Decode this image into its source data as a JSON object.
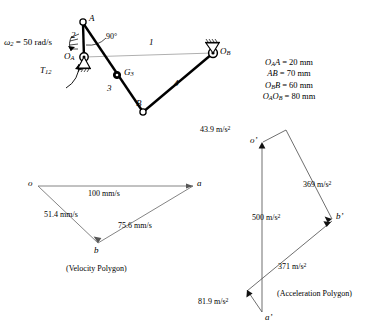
{
  "figure": {
    "type": "kinematics-diagram"
  },
  "mechanism": {
    "input_speed_label": "ω",
    "input_speed_sub": "2",
    "input_speed_value": "= 50 rad/s",
    "torque_label": "T",
    "torque_sub": "12",
    "angle_label": "90°",
    "joints": [
      {
        "name": "A",
        "label": "A",
        "x": 83,
        "y": 22
      },
      {
        "name": "O_A",
        "label": "O",
        "sub": "A",
        "x": 84,
        "y": 57
      },
      {
        "name": "G_3",
        "label": "G",
        "sub": "3",
        "x": 117,
        "y": 75
      },
      {
        "name": "B",
        "label": "B",
        "x": 143,
        "y": 112
      },
      {
        "name": "O_B",
        "label": "O",
        "sub": "B",
        "x": 213,
        "y": 53
      }
    ],
    "link_numbers": [
      {
        "label": "2",
        "x": 74,
        "y": 37
      },
      {
        "label": "1",
        "x": 152,
        "y": 45
      },
      {
        "label": "3",
        "x": 110,
        "y": 90
      },
      {
        "label": "4",
        "x": 177,
        "y": 85
      }
    ]
  },
  "dimensions": {
    "lines": [
      {
        "seg": "O",
        "sub": "A",
        "seg2": "A",
        "value": "= 20 mm"
      },
      {
        "seg": "AB",
        "value": "= 70 mm"
      },
      {
        "seg": "O",
        "sub": "B",
        "seg2": "B",
        "value": "= 60 mm"
      },
      {
        "seg": "O",
        "sub": "A",
        "seg2": "O",
        "sub2": "B",
        "value": "= 80 mm"
      }
    ],
    "text": [
      "OₐA = 20 mm",
      "AB = 70 mm",
      "O_BB = 60 mm",
      "O_AO_B = 80 mm"
    ]
  },
  "velocity_polygon": {
    "caption": "(Velocity Polygon)",
    "vertices": [
      {
        "label": "o",
        "x": 38,
        "y": 186
      },
      {
        "label": "a",
        "x": 193,
        "y": 186
      },
      {
        "label": "b",
        "x": 98,
        "y": 243
      }
    ],
    "edges": [
      {
        "from": "o",
        "to": "a",
        "label": "100 mm/s",
        "lx": 113,
        "ly": 196
      },
      {
        "from": "o",
        "to": "b",
        "label": "51.4 mm/s",
        "lx": 70,
        "ly": 216
      },
      {
        "from": "b",
        "to": "a",
        "label": "75.6 mm/s",
        "lx": 146,
        "ly": 227
      }
    ]
  },
  "acceleration_polygon": {
    "caption": "(Acceleration Polygon)",
    "vertices": [
      {
        "label": "o'",
        "x": 262,
        "y": 143
      },
      {
        "label": "b'",
        "x": 333,
        "y": 220
      },
      {
        "label": "a'",
        "x": 262,
        "y": 313
      },
      {
        "label": "apex",
        "x": 286,
        "y": 130
      }
    ],
    "edges": [
      {
        "name": "top-left",
        "label": "43.9 m/s",
        "sup": "2",
        "lx": 224,
        "ly": 133
      },
      {
        "name": "right-upper",
        "label": "369 m/s",
        "sup": "2",
        "lx": 318,
        "ly": 186
      },
      {
        "name": "vertical",
        "label": "500 m/s",
        "sup": "2",
        "lx": 268,
        "ly": 220
      },
      {
        "name": "lower",
        "label": "371 m/s",
        "sup": "2",
        "lx": 293,
        "ly": 268
      },
      {
        "name": "bottom-left",
        "label": "81.9 m/s",
        "sup": "2",
        "lx": 200,
        "ly": 303
      }
    ]
  }
}
